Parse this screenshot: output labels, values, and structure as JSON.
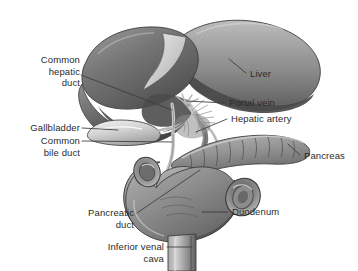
{
  "figure": {
    "background_color": "#ffffff",
    "label_color": "#2b2b2b",
    "leader_line_color": "#3a3a3a",
    "style": "grayscale pencil-shaded medical illustration"
  },
  "labels": {
    "common_hepatic_duct": "Common\nhepatic\nduct",
    "gallbladder": "Gallbladder",
    "common_bile_duct": "Common\nbile duct",
    "pancreatic_duct": "Pancreatic\nduct",
    "inferior_venal_cava": "Inferior venal\ncava",
    "liver": "Liver",
    "portal_vein": "Portal vein",
    "hepatic_artery": "Hepatic artery",
    "pancreas": "Pancreas",
    "duodenum": "Duodenum"
  },
  "structures": [
    {
      "name": "liver",
      "label": "Liver",
      "side": "right"
    },
    {
      "name": "portal-vein",
      "label": "Portal vein",
      "side": "right"
    },
    {
      "name": "hepatic-artery",
      "label": "Hepatic artery",
      "side": "right"
    },
    {
      "name": "pancreas",
      "label": "Pancreas",
      "side": "right"
    },
    {
      "name": "duodenum",
      "label": "Duodenum",
      "side": "right"
    },
    {
      "name": "common-hepatic-duct",
      "label": "Common hepatic duct",
      "side": "left"
    },
    {
      "name": "gallbladder",
      "label": "Gallbladder",
      "side": "left"
    },
    {
      "name": "common-bile-duct",
      "label": "Common bile duct",
      "side": "left"
    },
    {
      "name": "pancreatic-duct",
      "label": "Pancreatic duct",
      "side": "left"
    },
    {
      "name": "inferior-venal-cava",
      "label": "Inferior venal cava",
      "side": "left"
    }
  ],
  "palette": {
    "liver_dark": "#5c5c5c",
    "liver_mid": "#7d7d7d",
    "liver_light": "#a8a8a8",
    "gallbladder": "#cfcfcf",
    "pancreas": "#9a9a9a",
    "duodenum": "#8d8d8d",
    "vessel": "#bdbdbd",
    "outline": "#3c3c3c"
  }
}
